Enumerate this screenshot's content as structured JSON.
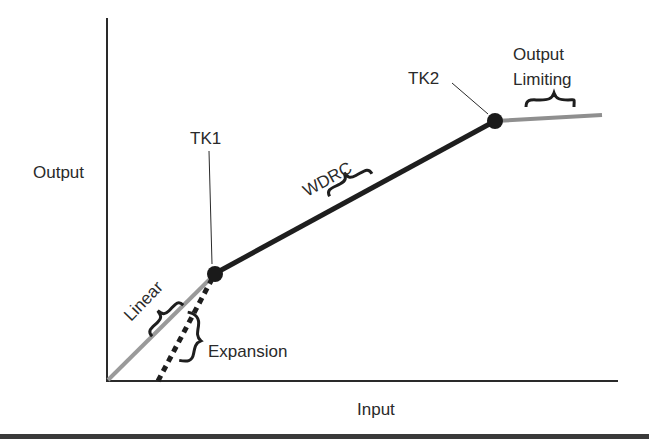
{
  "diagram": {
    "type": "compression-curve",
    "axes": {
      "x_label": "Input",
      "y_label": "Output"
    },
    "kneepoints": [
      {
        "id": "tk1",
        "label": "TK1"
      },
      {
        "id": "tk2",
        "label": "TK2"
      }
    ],
    "regions": {
      "linear": "Linear",
      "expansion": "Expansion",
      "wdrc": "WDRC",
      "output_limiting_line1": "Output",
      "output_limiting_line2": "Limiting"
    },
    "colors": {
      "axis": "#2a2a2a",
      "wdrc_line": "#1e1e1e",
      "linear_line": "#9a9a9a",
      "limiting_line": "#8f8f8f",
      "kneepoint": "#1a1a1a",
      "bottom_rule": "#3a3a3a"
    }
  }
}
